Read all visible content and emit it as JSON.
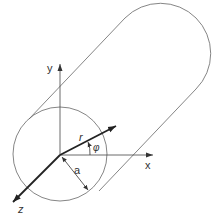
{
  "diagram": {
    "labels": {
      "y_axis": "y",
      "x_axis": "x",
      "z_axis": "z",
      "radius_vector": "r",
      "angle": "φ",
      "cylinder_radius": "a"
    },
    "colors": {
      "line": "#555555",
      "thick_line": "#222222",
      "text": "#333333",
      "background": "#ffffff"
    }
  }
}
